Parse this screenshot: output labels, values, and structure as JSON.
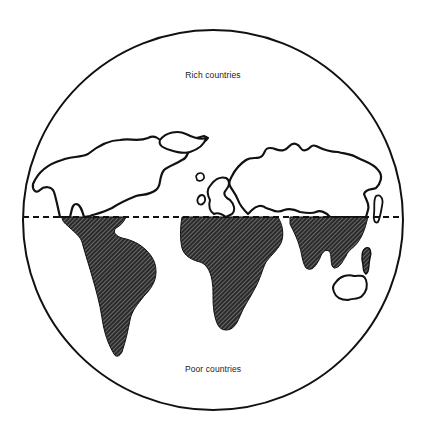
{
  "figure": {
    "type": "world-map-diagram",
    "labels": {
      "top": "Rich countries",
      "bottom": "Poor countries"
    },
    "divider": {
      "style": "dashed",
      "meaning": "North–South divide"
    },
    "regions": {
      "north": [
        "North America",
        "Europe",
        "Russia / Northern Asia",
        "Japan"
      ],
      "south": [
        "South America",
        "Africa",
        "Middle East / South Asia",
        "Southeast Asia"
      ],
      "exception_outlined": [
        "Australia",
        "New Zealand"
      ]
    },
    "colors": {
      "outline": "#111111",
      "hatch": "#1a1a1a",
      "background": "#ffffff"
    }
  }
}
